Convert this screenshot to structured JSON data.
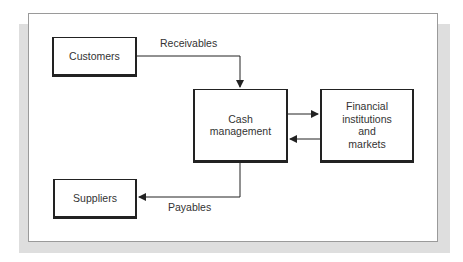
{
  "diagram": {
    "nodes": {
      "customers": "Customers",
      "cash_management_line1": "Cash",
      "cash_management_line2": "management",
      "financial_line1": "Financial",
      "financial_line2": "institutions",
      "financial_line3": "and",
      "financial_line4": "markets",
      "suppliers": "Suppliers"
    },
    "edges": {
      "receivables": "Receivables",
      "payables": "Payables"
    },
    "colors": {
      "line": "#222222",
      "shadow": "#dedede",
      "panel_border": "#9a9a9a"
    }
  }
}
